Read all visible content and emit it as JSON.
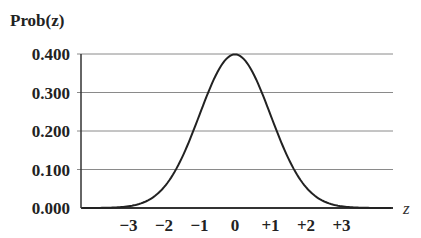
{
  "chart_data": {
    "type": "line",
    "title": "",
    "ylabel": "Prob(z)",
    "xlabel": "z",
    "ylim": [
      0,
      0.4
    ],
    "xlim": [
      -4,
      4.4
    ],
    "grid": true,
    "legend": null,
    "yticks": [
      "0.000",
      "0.100",
      "0.200",
      "0.300",
      "0.400"
    ],
    "ytick_values": [
      0,
      0.1,
      0.2,
      0.3,
      0.4
    ],
    "xticks": [
      "−3",
      "−2",
      "−1",
      "0",
      "+1",
      "+2",
      "+3"
    ],
    "xtick_values": [
      -3,
      -2,
      -1,
      0,
      1,
      2,
      3
    ],
    "series": [
      {
        "name": "Standard normal density",
        "x": [
          -4,
          -3.5,
          -3,
          -2.5,
          -2,
          -1.5,
          -1,
          -0.5,
          0,
          0.5,
          1,
          1.5,
          2,
          2.5,
          3,
          3.5,
          4
        ],
        "values": [
          0.0001,
          0.0009,
          0.0044,
          0.0175,
          0.054,
          0.1295,
          0.242,
          0.3521,
          0.3989,
          0.3521,
          0.242,
          0.1295,
          0.054,
          0.0175,
          0.0044,
          0.0009,
          0.0001
        ]
      }
    ]
  }
}
